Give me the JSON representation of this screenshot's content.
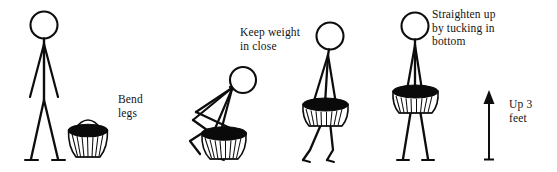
{
  "illustration": {
    "title": "Safe lifting technique, four-step stick figure sequence",
    "background_color": "#ffffff",
    "ink_color": "#0d0d0d",
    "width": 557,
    "height": 172
  },
  "labels": {
    "bend_legs": "Bend\nlegs",
    "keep_weight": "Keep weight\nin close",
    "straighten": "Straighten up\nby tucking in\nbottom",
    "up_three_feet": "Up 3\nfeet"
  },
  "steps": [
    {
      "index": 1,
      "caption": "Bend\nlegs",
      "posture": "standing upright beside basket on ground",
      "figure_name": "stick-figure-standing"
    },
    {
      "index": 2,
      "caption": "Keep weight\nin close",
      "posture": "squatting with bent knees gripping basket handle",
      "figure_name": "stick-figure-squatting"
    },
    {
      "index": 3,
      "caption": "Keep weight\nin close",
      "posture": "mid-lift carrying basket close to body",
      "figure_name": "stick-figure-lifting"
    },
    {
      "index": 4,
      "caption": "Straighten up\nby tucking in\nbottom",
      "posture": "standing straight holding basket at waist",
      "figure_name": "stick-figure-upright-carry"
    }
  ],
  "arrow": {
    "name": "up-arrow",
    "direction": "up",
    "label": "Up 3\nfeet"
  }
}
